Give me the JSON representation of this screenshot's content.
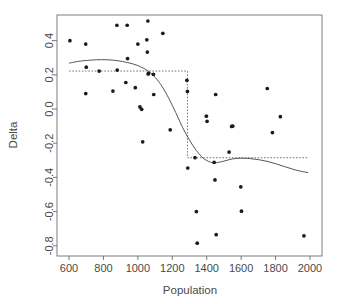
{
  "chart_data": {
    "type": "scatter",
    "title": "",
    "xlabel": "Population",
    "ylabel": "Delta",
    "xlim": [
      530,
      2070
    ],
    "ylim": [
      -0.86,
      0.55
    ],
    "xticks": [
      600,
      800,
      1000,
      1200,
      1400,
      1600,
      1800,
      2000
    ],
    "yticks": [
      0.4,
      0.2,
      0.0,
      -0.2,
      -0.4,
      -0.6,
      -0.8
    ],
    "ytick_labels": [
      "0.4",
      "0.2",
      "0.0",
      "-0.2",
      "-0.4",
      "-0.6",
      "-0.8"
    ],
    "xtick_labels": [
      "600",
      "800",
      "1000",
      "1200",
      "1400",
      "1600",
      "1800",
      "2000"
    ],
    "grid": false,
    "legend": "none",
    "point_color": "#1a1a1a",
    "point_size": 2.6,
    "axis_color": "#6e6e6e",
    "curve_color": "#555555",
    "step_color": "#666666",
    "points": [
      {
        "x": 605,
        "y": 0.4
      },
      {
        "x": 697,
        "y": 0.38
      },
      {
        "x": 700,
        "y": 0.245
      },
      {
        "x": 697,
        "y": 0.09
      },
      {
        "x": 775,
        "y": 0.222
      },
      {
        "x": 855,
        "y": 0.105
      },
      {
        "x": 878,
        "y": 0.49
      },
      {
        "x": 880,
        "y": 0.228
      },
      {
        "x": 930,
        "y": 0.155
      },
      {
        "x": 938,
        "y": 0.49
      },
      {
        "x": 940,
        "y": 0.295
      },
      {
        "x": 985,
        "y": 0.125
      },
      {
        "x": 1000,
        "y": 0.38
      },
      {
        "x": 1012,
        "y": 0.012
      },
      {
        "x": 1022,
        "y": -0.002
      },
      {
        "x": 1028,
        "y": -0.192
      },
      {
        "x": 1052,
        "y": 0.405
      },
      {
        "x": 1055,
        "y": 0.333
      },
      {
        "x": 1058,
        "y": 0.515
      },
      {
        "x": 1060,
        "y": 0.205
      },
      {
        "x": 1062,
        "y": 0.208
      },
      {
        "x": 1090,
        "y": 0.203
      },
      {
        "x": 1092,
        "y": 0.085
      },
      {
        "x": 1145,
        "y": 0.443
      },
      {
        "x": 1188,
        "y": -0.122
      },
      {
        "x": 1285,
        "y": 0.168
      },
      {
        "x": 1288,
        "y": 0.103
      },
      {
        "x": 1290,
        "y": -0.345
      },
      {
        "x": 1332,
        "y": -0.285
      },
      {
        "x": 1340,
        "y": -0.6
      },
      {
        "x": 1345,
        "y": -0.785
      },
      {
        "x": 1398,
        "y": -0.042
      },
      {
        "x": 1402,
        "y": -0.072
      },
      {
        "x": 1443,
        "y": -0.312
      },
      {
        "x": 1448,
        "y": -0.415
      },
      {
        "x": 1452,
        "y": 0.085
      },
      {
        "x": 1455,
        "y": -0.735
      },
      {
        "x": 1530,
        "y": -0.252
      },
      {
        "x": 1545,
        "y": -0.102
      },
      {
        "x": 1552,
        "y": -0.1
      },
      {
        "x": 1598,
        "y": -0.455
      },
      {
        "x": 1602,
        "y": -0.598
      },
      {
        "x": 1752,
        "y": 0.12
      },
      {
        "x": 1782,
        "y": -0.138
      },
      {
        "x": 1828,
        "y": -0.045
      },
      {
        "x": 1965,
        "y": -0.742
      }
    ],
    "loess_curve": [
      {
        "x": 600,
        "y": 0.268
      },
      {
        "x": 650,
        "y": 0.278
      },
      {
        "x": 700,
        "y": 0.284
      },
      {
        "x": 760,
        "y": 0.288
      },
      {
        "x": 820,
        "y": 0.288
      },
      {
        "x": 880,
        "y": 0.283
      },
      {
        "x": 940,
        "y": 0.272
      },
      {
        "x": 1000,
        "y": 0.254
      },
      {
        "x": 1060,
        "y": 0.222
      },
      {
        "x": 1100,
        "y": 0.186
      },
      {
        "x": 1140,
        "y": 0.133
      },
      {
        "x": 1180,
        "y": 0.062
      },
      {
        "x": 1220,
        "y": -0.021
      },
      {
        "x": 1260,
        "y": -0.108
      },
      {
        "x": 1300,
        "y": -0.182
      },
      {
        "x": 1340,
        "y": -0.243
      },
      {
        "x": 1380,
        "y": -0.288
      },
      {
        "x": 1420,
        "y": -0.31
      },
      {
        "x": 1450,
        "y": -0.315
      },
      {
        "x": 1500,
        "y": -0.305
      },
      {
        "x": 1550,
        "y": -0.292
      },
      {
        "x": 1600,
        "y": -0.288
      },
      {
        "x": 1650,
        "y": -0.29
      },
      {
        "x": 1700,
        "y": -0.296
      },
      {
        "x": 1750,
        "y": -0.306
      },
      {
        "x": 1800,
        "y": -0.32
      },
      {
        "x": 1850,
        "y": -0.336
      },
      {
        "x": 1900,
        "y": -0.352
      },
      {
        "x": 1950,
        "y": -0.365
      },
      {
        "x": 1990,
        "y": -0.372
      }
    ],
    "step_function": {
      "breakpoint": 1288,
      "level_left": 0.222,
      "level_right": -0.285,
      "x_start": 600,
      "x_end": 1993
    }
  },
  "axes": {
    "x_title": "Population",
    "y_title": "Delta"
  }
}
